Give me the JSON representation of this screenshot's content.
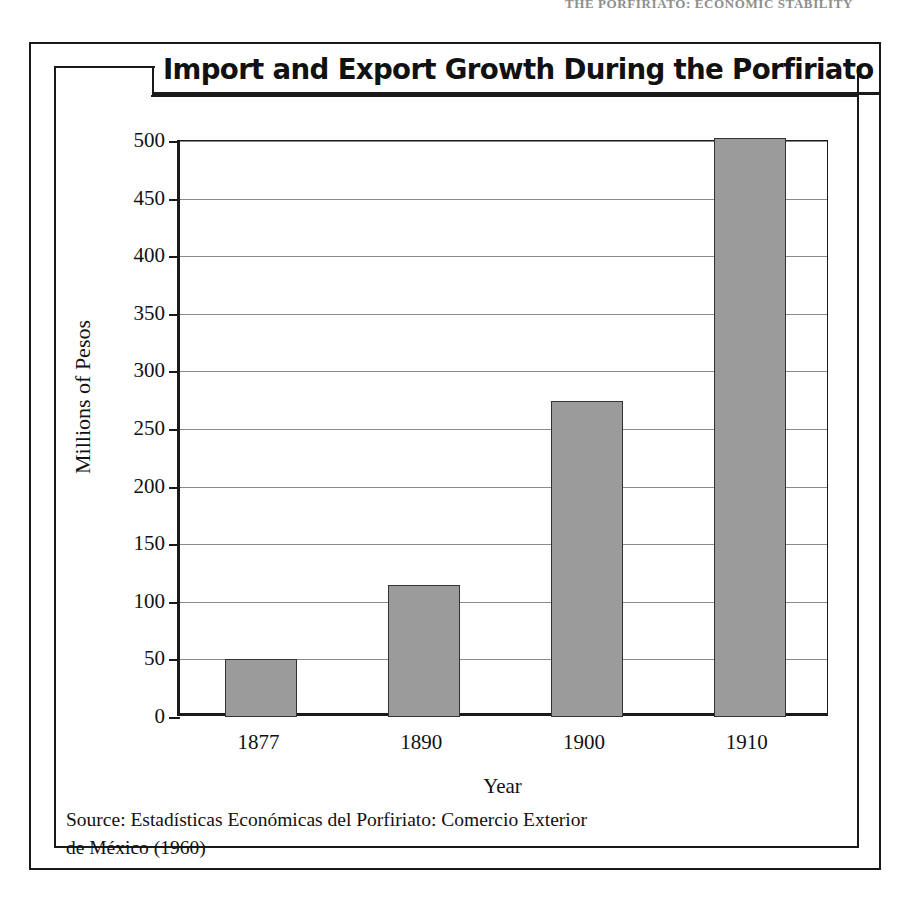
{
  "page": {
    "running_head": "THE PORFIRIATO: ECONOMIC STABILITY"
  },
  "figure": {
    "title": "Import and Export Growth During the Porfiriato",
    "source_line1": "Source: Estadísticas Económicas del Porfiriato: Comercio Exterior",
    "source_line2": "de México (1960)"
  },
  "chart_data": {
    "type": "bar",
    "title": "Import and Export Growth During the Porfiriato",
    "xlabel": "Year",
    "ylabel": "Millions of Pesos",
    "categories": [
      "1877",
      "1890",
      "1900",
      "1910"
    ],
    "values": [
      50,
      115,
      274,
      503
    ],
    "ylim": [
      0,
      500
    ],
    "yticks": [
      0,
      50,
      100,
      150,
      200,
      250,
      300,
      350,
      400,
      450,
      500
    ],
    "ytick_labels": [
      "0",
      "50",
      "100",
      "150",
      "200",
      "250",
      "300",
      "350",
      "400",
      "450",
      "500"
    ],
    "grid": true,
    "legend": false,
    "bar_color": "#9b9b9b",
    "bar_edge_color": "#333333",
    "axis_color": "#1a1a1a",
    "gridline_color": "#8a8a8a",
    "background": "#ffffff"
  }
}
